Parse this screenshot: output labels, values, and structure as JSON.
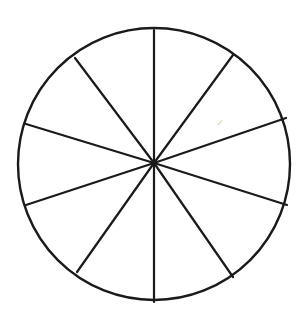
{
  "diagram": {
    "canvas": {
      "width": 308,
      "height": 319,
      "background": "#ffffff"
    },
    "circle": {
      "cx": 154,
      "cy": 164,
      "r": 136,
      "stroke": "#1a1a1a",
      "stroke_width": 2.4
    },
    "center": {
      "x": 154,
      "y": 163
    },
    "sector_count": 10,
    "spokes": [
      {
        "x": 154,
        "y": 30
      },
      {
        "x": 233,
        "y": 55
      },
      {
        "x": 286,
        "y": 118
      },
      {
        "x": 287,
        "y": 205
      },
      {
        "x": 233,
        "y": 277
      },
      {
        "x": 154,
        "y": 302
      },
      {
        "x": 77,
        "y": 272
      },
      {
        "x": 26,
        "y": 205
      },
      {
        "x": 26,
        "y": 124
      },
      {
        "x": 75,
        "y": 58
      }
    ],
    "spoke_stroke": "#1a1a1a",
    "spoke_stroke_width": 2.2,
    "stray_mark": {
      "x1": 218,
      "y1": 125,
      "x2": 222,
      "y2": 120,
      "stroke": "#d8cfb8"
    }
  }
}
